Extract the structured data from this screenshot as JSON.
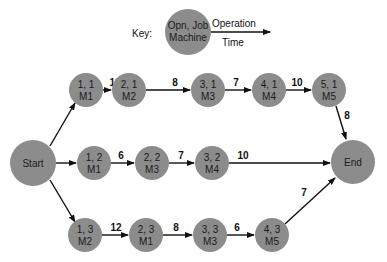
{
  "key": {
    "label": "Key:",
    "node_line1": "Opn, Job",
    "node_line2": "Machine",
    "edge_top": "Operation",
    "edge_bottom": "Time"
  },
  "colors": {
    "node_fill": "#8c8c8c",
    "edge": "#111111",
    "background": "#ffffff"
  },
  "nodes": {
    "start": {
      "label": "Start"
    },
    "end": {
      "label": "End"
    },
    "n11": {
      "line1": "1, 1",
      "line2": "M1"
    },
    "n21": {
      "line1": "2, 1",
      "line2": "M2"
    },
    "n31": {
      "line1": "3, 1",
      "line2": "M3"
    },
    "n41": {
      "line1": "4, 1",
      "line2": "M4"
    },
    "n51": {
      "line1": "5, 1",
      "line2": "M5"
    },
    "n12": {
      "line1": "1, 2",
      "line2": "M1"
    },
    "n22": {
      "line1": "2, 2",
      "line2": "M3"
    },
    "n32": {
      "line1": "3, 2",
      "line2": "M4"
    },
    "n13": {
      "line1": "1, 3",
      "line2": "M2"
    },
    "n23": {
      "line1": "2, 3",
      "line2": "M1"
    },
    "n33": {
      "line1": "3, 3",
      "line2": "M3"
    },
    "n43": {
      "line1": "4, 3",
      "line2": "M5"
    }
  },
  "edges": {
    "e11_21": "10",
    "e21_31": "8",
    "e31_41": "7",
    "e41_51": "10",
    "e51_end": "8",
    "e12_22": "6",
    "e22_32": "7",
    "e32_end": "10",
    "e13_23": "12",
    "e23_33": "8",
    "e33_43": "6",
    "e43_end": "7"
  }
}
